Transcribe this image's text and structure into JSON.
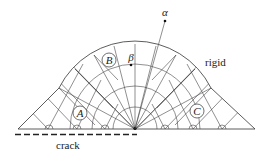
{
  "labels": {
    "alpha": "α",
    "beta": "β",
    "rigid": "rigid",
    "crack": "crack",
    "region_a": "A",
    "region_b": "B",
    "region_c": "C"
  },
  "colors": {
    "line": "#333333",
    "background": "#ffffff"
  }
}
